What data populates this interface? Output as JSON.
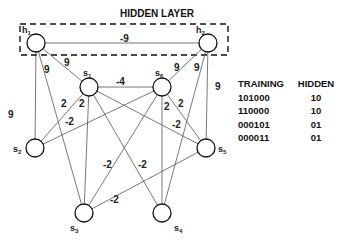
{
  "title": "HIDDEN LAYER",
  "nodes": [
    {
      "id": "h1",
      "base": "h",
      "sub": "1",
      "x": 36,
      "y": 43
    },
    {
      "id": "h2",
      "base": "h",
      "sub": "2",
      "x": 208,
      "y": 43
    },
    {
      "id": "s1",
      "base": "s",
      "sub": "1",
      "x": 89,
      "y": 87
    },
    {
      "id": "s6",
      "base": "s",
      "sub": "6",
      "x": 162,
      "y": 87
    },
    {
      "id": "s2",
      "base": "s",
      "sub": "2",
      "x": 35,
      "y": 148
    },
    {
      "id": "s5",
      "base": "s",
      "sub": "5",
      "x": 206,
      "y": 148
    },
    {
      "id": "s3",
      "base": "s",
      "sub": "3",
      "x": 84,
      "y": 213
    },
    {
      "id": "s4",
      "base": "s",
      "sub": "4",
      "x": 162,
      "y": 213
    }
  ],
  "edges": [
    {
      "from": "h1",
      "to": "h2",
      "weight": "-9"
    },
    {
      "from": "h1",
      "to": "s2",
      "weight": "9"
    },
    {
      "from": "h1",
      "to": "s3",
      "weight": "9"
    },
    {
      "from": "h1",
      "to": "s1",
      "weight": "9"
    },
    {
      "from": "h2",
      "to": "s6",
      "weight": "9"
    },
    {
      "from": "h2",
      "to": "s4",
      "weight": "9"
    },
    {
      "from": "h2",
      "to": "s5",
      "weight": "9"
    },
    {
      "from": "s1",
      "to": "s6",
      "weight": "-4"
    },
    {
      "from": "s1",
      "to": "s2",
      "weight": "2"
    },
    {
      "from": "s1",
      "to": "s3",
      "weight": "2"
    },
    {
      "from": "s1",
      "to": "s5",
      "weight": "-2"
    },
    {
      "from": "s1",
      "to": "s4",
      "weight": "-2"
    },
    {
      "from": "s6",
      "to": "s2",
      "weight": "-2"
    },
    {
      "from": "s6",
      "to": "s4",
      "weight": "2"
    },
    {
      "from": "s6",
      "to": "s5",
      "weight": "2"
    },
    {
      "from": "s6",
      "to": "s3",
      "weight": "-2"
    },
    {
      "from": "s3",
      "to": "s5",
      "weight": "-2"
    }
  ],
  "weight_labels": [
    {
      "text": "-9",
      "x": 120,
      "y": 42
    },
    {
      "text": "9",
      "x": 8,
      "y": 118
    },
    {
      "text": "9",
      "x": 44,
      "y": 73
    },
    {
      "text": "9",
      "x": 64,
      "y": 66
    },
    {
      "text": "9",
      "x": 174,
      "y": 71
    },
    {
      "text": "9",
      "x": 194,
      "y": 71
    },
    {
      "text": "9",
      "x": 215,
      "y": 90
    },
    {
      "text": "-4",
      "x": 116,
      "y": 85
    },
    {
      "text": "2",
      "x": 61,
      "y": 107
    },
    {
      "text": "2",
      "x": 79,
      "y": 107
    },
    {
      "text": "-2",
      "x": 65,
      "y": 125
    },
    {
      "text": "2",
      "x": 164,
      "y": 110
    },
    {
      "text": "2",
      "x": 178,
      "y": 107
    },
    {
      "text": "-2",
      "x": 172,
      "y": 128
    },
    {
      "text": "-2",
      "x": 103,
      "y": 168
    },
    {
      "text": "-2",
      "x": 138,
      "y": 168
    },
    {
      "text": "-2",
      "x": 110,
      "y": 203
    }
  ],
  "table": {
    "headers": [
      "TRAINING",
      "HIDDEN"
    ],
    "rows": [
      [
        "101000",
        "10"
      ],
      [
        "110000",
        "10"
      ],
      [
        "000101",
        "01"
      ],
      [
        "000011",
        "01"
      ]
    ]
  }
}
